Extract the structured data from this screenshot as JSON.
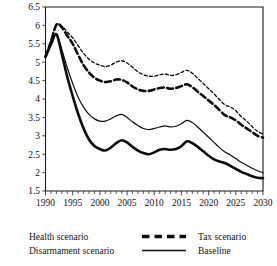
{
  "chart_data": {
    "type": "line",
    "title": "",
    "xlabel": "",
    "ylabel": "",
    "xlim": [
      1990,
      2030
    ],
    "ylim": [
      1.5,
      6.5
    ],
    "grid": false,
    "legend_position": "below-plot",
    "x_ticks_major": [
      "1990",
      "1995",
      "2000",
      "2005",
      "2010",
      "2015",
      "2020",
      "2025",
      "2030"
    ],
    "x_tick_minor_interval": 1,
    "y_ticks": [
      "6.5",
      "6",
      "5.5",
      "5",
      "4.5",
      "4",
      "3.5",
      "3",
      "2.5",
      "2",
      "1.5"
    ],
    "x": [
      1990,
      1991,
      1992,
      1993,
      1994,
      1995,
      1996,
      1997,
      1998,
      1999,
      2000,
      2001,
      2002,
      2003,
      2004,
      2005,
      2006,
      2007,
      2008,
      2009,
      2010,
      2011,
      2012,
      2013,
      2014,
      2015,
      2016,
      2017,
      2018,
      2019,
      2020,
      2021,
      2022,
      2023,
      2024,
      2025,
      2026,
      2027,
      2028,
      2029,
      2030
    ],
    "series": [
      {
        "name": "Health scenario",
        "style": "thick-dashed",
        "values": [
          5.15,
          5.55,
          6.02,
          5.95,
          5.72,
          5.5,
          5.2,
          4.92,
          4.72,
          4.58,
          4.5,
          4.46,
          4.48,
          4.53,
          4.52,
          4.45,
          4.34,
          4.26,
          4.22,
          4.22,
          4.26,
          4.3,
          4.31,
          4.28,
          4.3,
          4.35,
          4.4,
          4.32,
          4.2,
          4.08,
          3.96,
          3.84,
          3.7,
          3.56,
          3.5,
          3.42,
          3.3,
          3.2,
          3.1,
          3.0,
          2.95
        ]
      },
      {
        "name": "Tax scenario",
        "style": "thin-dashed",
        "values": [
          5.15,
          5.6,
          6.02,
          5.98,
          5.82,
          5.66,
          5.45,
          5.24,
          5.08,
          4.98,
          4.92,
          4.88,
          4.92,
          5.0,
          5.04,
          4.98,
          4.86,
          4.74,
          4.66,
          4.62,
          4.62,
          4.66,
          4.68,
          4.64,
          4.66,
          4.72,
          4.78,
          4.7,
          4.56,
          4.42,
          4.28,
          4.14,
          3.98,
          3.84,
          3.78,
          3.68,
          3.52,
          3.4,
          3.25,
          3.12,
          3.05
        ]
      },
      {
        "name": "Baseline",
        "style": "thin-solid",
        "values": [
          5.15,
          5.5,
          5.78,
          5.35,
          4.85,
          4.42,
          4.05,
          3.78,
          3.58,
          3.46,
          3.4,
          3.4,
          3.46,
          3.54,
          3.58,
          3.5,
          3.38,
          3.28,
          3.2,
          3.17,
          3.2,
          3.24,
          3.27,
          3.24,
          3.26,
          3.33,
          3.42,
          3.36,
          3.24,
          3.1,
          2.96,
          2.82,
          2.68,
          2.56,
          2.48,
          2.38,
          2.28,
          2.2,
          2.12,
          2.05,
          2.0
        ]
      },
      {
        "name": "Disarmament scenario",
        "style": "thick-solid",
        "values": [
          5.15,
          5.48,
          5.76,
          5.22,
          4.6,
          4.08,
          3.6,
          3.2,
          2.9,
          2.72,
          2.64,
          2.6,
          2.68,
          2.8,
          2.88,
          2.82,
          2.7,
          2.6,
          2.53,
          2.5,
          2.55,
          2.62,
          2.64,
          2.62,
          2.64,
          2.72,
          2.85,
          2.8,
          2.7,
          2.58,
          2.46,
          2.36,
          2.3,
          2.26,
          2.18,
          2.1,
          2.02,
          1.96,
          1.9,
          1.86,
          1.85
        ]
      }
    ]
  },
  "legend": {
    "entries": [
      {
        "label": "Health scenario",
        "swatch": "none"
      },
      {
        "label": "Tax scenario",
        "swatch": "thick-dashed"
      },
      {
        "label": "Disarmament scenario",
        "swatch": "none"
      },
      {
        "label": "Baseline",
        "swatch": "thin-solid"
      }
    ]
  },
  "colors": {
    "line": "#0d0d0d",
    "axis": "#1a1a1a",
    "background": "#ffffff"
  }
}
